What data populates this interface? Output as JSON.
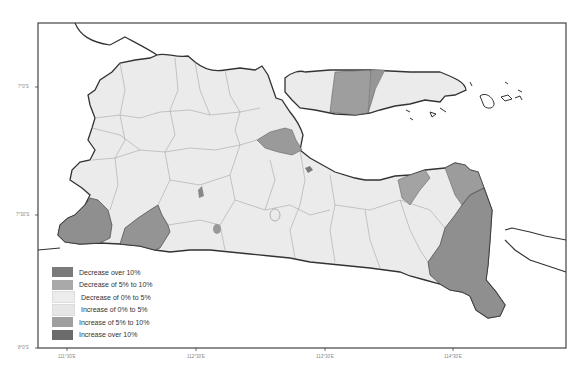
{
  "map": {
    "region": "East Java and Madura",
    "frame": {
      "x": 38,
      "y": 23,
      "width": 528,
      "height": 325
    },
    "colors": {
      "sea": "#ffffff",
      "outside_land": "#ffffff",
      "coast_stroke": "#333333",
      "district_stroke": "#8a8a8a"
    }
  },
  "legend": {
    "items": [
      {
        "label": "Decrease over 10%",
        "color": "#7a7a7a"
      },
      {
        "label": "Decrease of 5% to 10%",
        "color": "#a9a9a9"
      },
      {
        "label": "Decrease of 0% to 5%",
        "color": "#ececec"
      },
      {
        "label": "Increase of 0% to 5%",
        "color": "#e6e6e6"
      },
      {
        "label": "Increase of 5% to 10%",
        "color": "#9f9f9f"
      },
      {
        "label": "Increase over 10%",
        "color": "#6b6b6b"
      }
    ]
  },
  "axes": {
    "x_ticks": [
      {
        "label": "111°30'E",
        "x": 67
      },
      {
        "label": "112°30'E",
        "x": 196
      },
      {
        "label": "113°30'E",
        "x": 325
      },
      {
        "label": "114°30'E",
        "x": 453
      }
    ],
    "y_ticks": [
      {
        "label": "7°0'S",
        "y": 87
      },
      {
        "label": "7°30'S",
        "y": 215
      },
      {
        "label": "8°0'S",
        "y": 348
      }
    ]
  }
}
